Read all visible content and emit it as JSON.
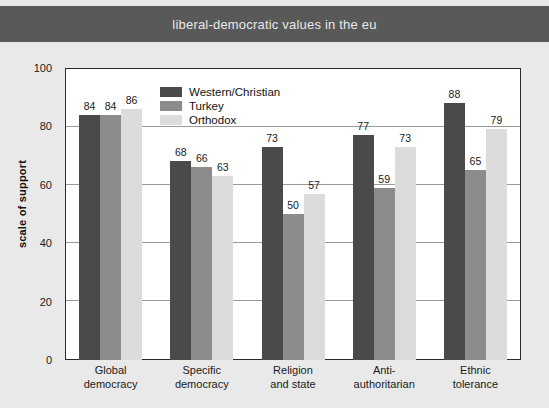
{
  "header": {
    "title": "liberal-democratic values in the eu",
    "band_color": "#595959",
    "text_color": "#e8e8e8"
  },
  "figure": {
    "background": "#e9e9e9",
    "plot_background": "#ffffff",
    "source_note": ""
  },
  "legend": {
    "position": "inside-top-left",
    "entries": [
      {
        "label": "Western/Christian",
        "color": "#4a4a4a"
      },
      {
        "label": "Turkey",
        "color": "#8c8c8c"
      },
      {
        "label": "Orthodox",
        "color": "#dcdcdc"
      }
    ]
  },
  "chart_data": {
    "type": "bar",
    "title": "liberal-democratic values in the eu",
    "xlabel": "",
    "ylabel": "scale of support",
    "ylim": [
      0,
      100
    ],
    "yticks": [
      0,
      20,
      40,
      60,
      80,
      100
    ],
    "grid": true,
    "categories": [
      "Global democracy",
      "Specific democracy",
      "Religion and state",
      "Anti-authoritarian",
      "Ethnic tolerance"
    ],
    "category_lines": [
      [
        "Global",
        "democracy"
      ],
      [
        "Specific",
        "democracy"
      ],
      [
        "Religion",
        "and state"
      ],
      [
        "Anti-",
        "authoritarian"
      ],
      [
        "Ethnic",
        "tolerance"
      ]
    ],
    "series": [
      {
        "name": "Western/Christian",
        "color": "#4a4a4a",
        "values": [
          84,
          68,
          73,
          77,
          88
        ]
      },
      {
        "name": "Turkey",
        "color": "#8c8c8c",
        "values": [
          84,
          66,
          50,
          59,
          65
        ]
      },
      {
        "name": "Orthodox",
        "color": "#dcdcdc",
        "values": [
          86,
          63,
          57,
          73,
          79
        ]
      }
    ]
  }
}
